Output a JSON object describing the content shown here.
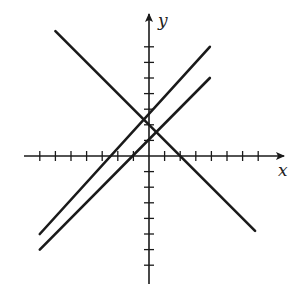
{
  "diagram": {
    "type": "coordinate-plane",
    "axes": {
      "x_label": "x",
      "y_label": "y",
      "origin_px": [
        149,
        156
      ],
      "unit_px": 15.6,
      "x_ticks": [
        -7,
        -6,
        -5,
        -4,
        -3,
        -2,
        -1,
        1,
        2,
        3,
        4,
        5,
        6,
        7
      ],
      "y_ticks": [
        -7,
        -6,
        -5,
        -4,
        -3,
        -2,
        -1,
        1,
        2,
        3,
        4,
        5,
        6,
        7
      ]
    },
    "lines": [
      {
        "name": "line-descending",
        "slope": -1,
        "intercept": 1,
        "from": [
          -6,
          8
        ],
        "to": [
          6.8,
          -4.8
        ]
      },
      {
        "name": "line-ascending-upper",
        "slope": 1,
        "intercept": 2,
        "from": [
          -7,
          -5
        ],
        "to": [
          3.9,
          7
        ]
      },
      {
        "name": "line-ascending-lower",
        "slope": 1,
        "intercept": 1,
        "from": [
          -7,
          -6
        ],
        "to": [
          3.9,
          5
        ]
      }
    ],
    "stroke_color": "#1a1a1a"
  }
}
